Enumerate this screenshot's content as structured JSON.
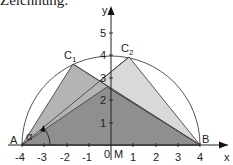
{
  "caption": "Zeichnung:",
  "diagram": {
    "type": "geometry",
    "axes": {
      "x_label": "x",
      "y_label": "y",
      "x_ticks": [
        "-4",
        "-3",
        "-2",
        "-1",
        "0",
        "1",
        "2",
        "3",
        "4"
      ],
      "y_ticks": [
        "1",
        "2",
        "3",
        "4",
        "5"
      ]
    },
    "points": {
      "A": {
        "label": "A",
        "x": -4,
        "y": 0
      },
      "B": {
        "label": "B",
        "x": 4,
        "y": 0
      },
      "C1": {
        "label": "C",
        "sub": "1",
        "x": -1.7,
        "y": 3.6
      },
      "C2": {
        "label": "C",
        "sub": "2",
        "x": 0.8,
        "y": 3.9
      },
      "M": {
        "label": "M",
        "x": 0,
        "y": 0
      }
    },
    "angle_label": "α",
    "semicircle": {
      "center": "M",
      "radius": 4
    },
    "colors": {
      "triangle_c1": "#b4b4b4",
      "triangle_c2": "#d9d9d9",
      "overlap": "#8f8f8f",
      "lines": "#333333"
    }
  }
}
